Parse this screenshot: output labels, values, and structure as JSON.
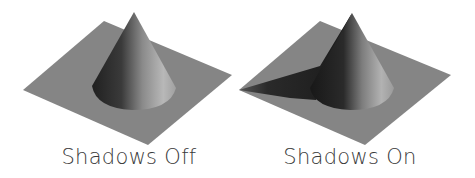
{
  "panels": [
    {
      "label": "Shadows Off",
      "shadows": false
    },
    {
      "label": "Shadows On",
      "shadows": true
    }
  ],
  "colors": {
    "background": "#ffffff",
    "plane": "#858585",
    "cone_dark": "#1e1e1e",
    "cone_light": "#b5b5b5",
    "shadow": "#1c1c1c",
    "label": "#3a3a3a"
  }
}
